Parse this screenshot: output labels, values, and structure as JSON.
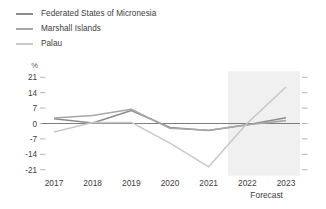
{
  "legend": {
    "position": "top-left",
    "items": [
      {
        "label": "Federated States of Micronesia",
        "color": "#8c8c8c",
        "icon": "line-swatch-icon"
      },
      {
        "label": "Marshall Islands",
        "color": "#a8a8a8",
        "icon": "line-swatch-icon"
      },
      {
        "label": "Palau",
        "color": "#c9c9c9",
        "icon": "line-swatch-icon"
      }
    ]
  },
  "axis": {
    "y_unit": "%",
    "y_ticks": [
      "21",
      "14",
      "7",
      "0",
      "-7",
      "-14",
      "-21"
    ],
    "x_ticks": [
      "2017",
      "2018",
      "2019",
      "2020",
      "2021",
      "2022",
      "2023"
    ],
    "forecast_label": "Forecast"
  },
  "colors": {
    "background": "#ffffff",
    "forecast_band": "#f0f0f0",
    "zero_line": "#6f6f6f",
    "tick": "#b4b4b4",
    "text": "#3d3d3d"
  },
  "chart_data": {
    "type": "line",
    "title": "",
    "subtitle": "",
    "xlabel": "",
    "ylabel": "%",
    "x": [
      2017,
      2018,
      2019,
      2020,
      2021,
      2022,
      2023
    ],
    "categories": [
      "2017",
      "2018",
      "2019",
      "2020",
      "2021",
      "2022",
      "2023"
    ],
    "ylim": [
      -21,
      21
    ],
    "ytick_values": [
      21,
      14,
      7,
      0,
      -7,
      -14,
      -21
    ],
    "grid": false,
    "legend_position": "top-left",
    "forecast_start": 2021.5,
    "annotations": [
      {
        "text": "Forecast",
        "x": 2022.5,
        "y": -26,
        "note": "label beneath shaded forecast band covering 2022-2023"
      }
    ],
    "series": [
      {
        "name": "Federated States of Micronesia",
        "color": "#8c8c8c",
        "values": [
          2.2,
          0.2,
          5.9,
          -1.8,
          -3.2,
          -0.6,
          2.6
        ]
      },
      {
        "name": "Marshall Islands",
        "color": "#a8a8a8",
        "values": [
          2.5,
          3.6,
          6.5,
          -2.2,
          -3.1,
          -0.6,
          1.3
        ]
      },
      {
        "name": "Palau",
        "color": "#c9c9c9",
        "values": [
          -3.9,
          0.4,
          0.5,
          -8.9,
          -19.7,
          0.2,
          16.6
        ]
      }
    ]
  }
}
